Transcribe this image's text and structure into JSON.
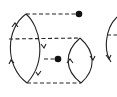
{
  "diagram": {
    "type": "feynman-diagram",
    "background": "#ffffff",
    "stroke_color": "#222222",
    "fermion_loops": [
      {
        "id": "left-loop",
        "top": [
          26,
          14
        ],
        "bottom": [
          27,
          83
        ],
        "left_arrow": "up",
        "right_arrow": "down"
      },
      {
        "id": "right-loop",
        "top": [
          80,
          38
        ],
        "bottom": [
          81,
          83
        ],
        "left_arrow": "up",
        "right_arrow": "down"
      },
      {
        "id": "partial-loop",
        "clipped": true,
        "arrow": "down"
      }
    ],
    "dashed_lines": [
      {
        "from": [
          26,
          14
        ],
        "to": [
          79,
          14
        ]
      },
      {
        "from": [
          9,
          39
        ],
        "to": [
          80,
          38
        ]
      },
      {
        "from": [
          44,
          59
        ],
        "to": [
          58,
          59
        ]
      },
      {
        "from": [
          27,
          83
        ],
        "to": [
          81,
          83
        ]
      },
      {
        "from": [
          108,
          35
        ],
        "to": [
          117,
          35
        ]
      }
    ],
    "vertices_dots": [
      {
        "at": [
          79,
          14
        ]
      },
      {
        "at": [
          58,
          59
        ]
      }
    ]
  }
}
